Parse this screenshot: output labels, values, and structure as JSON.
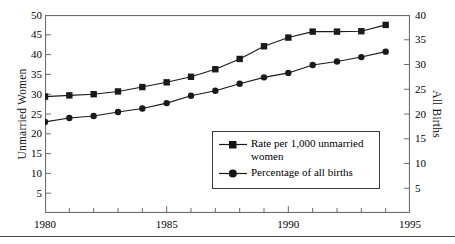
{
  "chart_data": {
    "type": "line",
    "title": "",
    "xlabel": "",
    "x": [
      1980,
      1981,
      1982,
      1983,
      1984,
      1985,
      1986,
      1987,
      1988,
      1989,
      1990,
      1991,
      1992,
      1993,
      1994
    ],
    "xlim": [
      1980,
      1995
    ],
    "xticks": [
      1980,
      1985,
      1990,
      1995
    ],
    "xtick_labels": [
      "1980",
      "1985",
      "1990",
      "1995"
    ],
    "x_minor_tick_interval": 1,
    "grid": false,
    "legend_position": "center-right-inside",
    "axes": [
      {
        "id": "left",
        "label": "Unmarried Women",
        "lim": [
          0,
          50
        ],
        "ticks": [
          5,
          10,
          15,
          20,
          25,
          30,
          35,
          40,
          45,
          50
        ],
        "tick_labels": [
          "5",
          "10",
          "15",
          "20",
          "25",
          "30",
          "35",
          "40",
          "45",
          "50"
        ]
      },
      {
        "id": "right",
        "label": "All Births",
        "lim": [
          0,
          40
        ],
        "ticks": [
          5,
          10,
          15,
          20,
          25,
          30,
          35,
          40
        ],
        "tick_labels": [
          "5",
          "10",
          "15",
          "20",
          "25",
          "30",
          "35",
          "40"
        ]
      }
    ],
    "series": [
      {
        "name": "Rate per 1,000 unmarried women",
        "axis": "left",
        "marker": "square",
        "color": "#1a1a1a",
        "values": [
          29.4,
          29.7,
          30.0,
          30.7,
          31.8,
          33.0,
          34.4,
          36.3,
          38.9,
          42.1,
          44.3,
          45.8,
          45.8,
          45.9,
          47.5
        ]
      },
      {
        "name": "Percentage of all births",
        "axis": "right",
        "marker": "circle",
        "color": "#1a1a1a",
        "values": [
          18.4,
          19.2,
          19.6,
          20.4,
          21.1,
          22.2,
          23.7,
          24.7,
          26.1,
          27.4,
          28.3,
          29.9,
          30.6,
          31.5,
          32.6
        ]
      }
    ]
  },
  "legend": {
    "items": [
      {
        "label": "Rate per 1,000 unmarried women",
        "marker": "square"
      },
      {
        "label": "Percentage of all births",
        "marker": "circle"
      }
    ]
  },
  "style": {
    "frame_color": "#6e6e6e",
    "line_color": "#1a1a1a",
    "marker_color": "#1a1a1a",
    "background": "#ffffff"
  }
}
